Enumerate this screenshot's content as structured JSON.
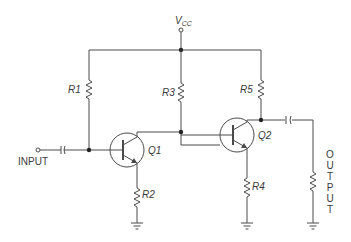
{
  "diagram": {
    "type": "schematic",
    "title": "",
    "supply": {
      "label_main": "V",
      "label_sub": "CC"
    },
    "input": {
      "label": "INPUT"
    },
    "output": {
      "label_letters": [
        "O",
        "U",
        "T",
        "P",
        "U",
        "T"
      ]
    },
    "resistors": [
      {
        "id": "R1",
        "label": "R1"
      },
      {
        "id": "R2",
        "label": "R2"
      },
      {
        "id": "R3",
        "label": "R3"
      },
      {
        "id": "R4",
        "label": "R4"
      },
      {
        "id": "R5",
        "label": "R5"
      }
    ],
    "transistors": [
      {
        "id": "Q1",
        "label": "Q1",
        "kind": "NPN"
      },
      {
        "id": "Q2",
        "label": "Q2",
        "kind": "NPN"
      }
    ],
    "capacitors": [
      {
        "id": "C_in",
        "role": "input coupling"
      },
      {
        "id": "C_out",
        "role": "output coupling"
      }
    ],
    "load": {
      "id": "R_load",
      "role": "output load resistor"
    },
    "colors": {
      "line": "#4a4a4a",
      "text": "#3a3a3a",
      "background": "#ffffff"
    }
  }
}
